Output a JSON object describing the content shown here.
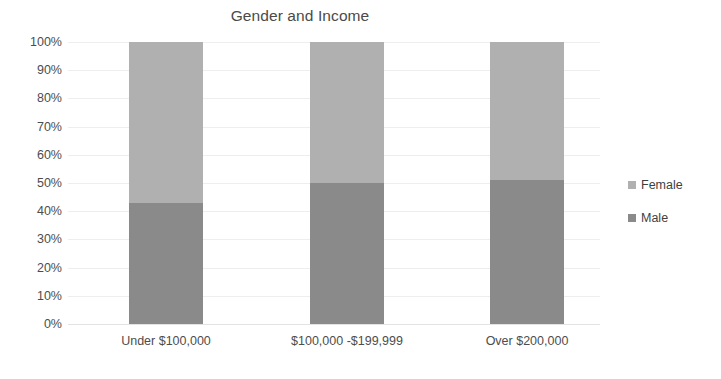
{
  "chart_data": {
    "type": "bar",
    "subtype": "100-percent-stacked-column",
    "title": "Gender and Income",
    "xlabel": "",
    "ylabel": "",
    "categories": [
      "Under $100,000",
      "$100,000 -$199,999",
      "Over $200,000"
    ],
    "series": [
      {
        "name": "Female",
        "values": [
          57,
          50,
          49
        ],
        "color": "#b0b0b0"
      },
      {
        "name": "Male",
        "values": [
          43,
          50,
          51
        ],
        "color": "#8a8a8a"
      }
    ],
    "stack_order_bottom_to_top": [
      "Male",
      "Female"
    ],
    "ylim": [
      0,
      100
    ],
    "y_ticks": [
      "0%",
      "10%",
      "20%",
      "30%",
      "40%",
      "50%",
      "60%",
      "70%",
      "80%",
      "90%",
      "100%"
    ],
    "y_tick_values": [
      0,
      10,
      20,
      30,
      40,
      50,
      60,
      70,
      80,
      90,
      100
    ],
    "grid": true,
    "legend_position": "right",
    "legend_entries": [
      "Female",
      "Male"
    ],
    "value_unit": "%"
  },
  "colors": {
    "female": "#b0b0b0",
    "male": "#8a8a8a",
    "gridline": "#eeeeee",
    "baseline": "#e3e3e3",
    "text": "#4d4d4d",
    "title_text": "#4a4a4a",
    "background": "#ffffff"
  }
}
